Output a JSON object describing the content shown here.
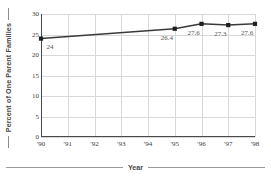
{
  "chart_data": {
    "type": "line",
    "title": "",
    "xlabel": "Year",
    "ylabel": "Percent of One Parent Families",
    "x": [
      "'90",
      "'91",
      "'92",
      "'93",
      "'94",
      "'95",
      "'96",
      "'97",
      "'98"
    ],
    "xtick_labels": [
      "'90",
      "'91",
      "'92",
      "'93",
      "'94",
      "'95",
      "'96",
      "'97",
      "'98"
    ],
    "ytick_labels": [
      "0",
      "5",
      "10",
      "15",
      "20",
      "25",
      "30"
    ],
    "ytick_values": [
      0,
      5,
      10,
      15,
      20,
      25,
      30
    ],
    "ylim": [
      0,
      30
    ],
    "grid": true,
    "legend": "none",
    "series": [
      {
        "name": "Percent of One Parent Families",
        "marker_years": [
          "'90",
          "'95",
          "'96",
          "'97",
          "'98"
        ],
        "marker_values": [
          24,
          26.4,
          27.6,
          27.3,
          27.6
        ],
        "point_labels": [
          "24",
          "26.4",
          "27.6",
          "27.3",
          "27.6"
        ],
        "line_color": "#3a3a3a",
        "marker_color": "#1f1f1f"
      }
    ],
    "colors": {
      "background": "#ffffff",
      "gridline": "#d8d8d8",
      "axis": "#4a4a4a",
      "tick_text": "#3c3c3c",
      "label_text": "#555555",
      "axis_title": "#4a4a4a"
    }
  }
}
